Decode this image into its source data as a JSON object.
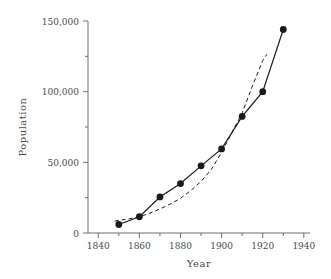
{
  "chart_data": {
    "type": "line",
    "title": "",
    "xlabel": "Year",
    "ylabel": "Population",
    "xlim": [
      1835,
      1943
    ],
    "ylim": [
      0,
      150000
    ],
    "grid": false,
    "legend": "none",
    "x_ticks": [
      1840,
      1860,
      1880,
      1900,
      1920,
      1940
    ],
    "x_tick_labels": [
      "1840",
      "1860",
      "1880",
      "1900",
      "1920",
      "1940"
    ],
    "x_minor_ticks": [
      1850,
      1870,
      1890,
      1910,
      1930
    ],
    "y_ticks": [
      0,
      50000,
      100000,
      150000
    ],
    "y_tick_labels": [
      "0",
      "50,000",
      "100,000",
      "150,000"
    ],
    "y_minor_ticks": [
      25000,
      75000,
      125000
    ],
    "series": [
      {
        "name": "observed",
        "style": "solid-with-markers",
        "marker": "filled-circle",
        "color": "#1a1a1a",
        "x": [
          1850,
          1860,
          1870,
          1880,
          1890,
          1900,
          1910,
          1920,
          1930
        ],
        "values": [
          6000,
          11500,
          25500,
          35000,
          47500,
          59500,
          82500,
          100000,
          144000
        ]
      },
      {
        "name": "fitted-trend",
        "style": "dashed",
        "marker": "none",
        "color": "#1a1a1a",
        "x": [
          1848,
          1855,
          1860,
          1865,
          1870,
          1875,
          1880,
          1885,
          1890,
          1895,
          1900,
          1905,
          1910,
          1915,
          1920,
          1922
        ],
        "values": [
          8500,
          10000,
          11500,
          14000,
          17000,
          20500,
          24500,
          30000,
          36500,
          45000,
          57000,
          71000,
          85000,
          104000,
          122000,
          126500
        ]
      }
    ]
  },
  "axis_labels": {
    "x": "Year",
    "y": "Population"
  },
  "colors": {
    "axis": "#6e6e6e",
    "text": "#4a4a4a",
    "data": "#1a1a1a",
    "background": "#ffffff"
  }
}
